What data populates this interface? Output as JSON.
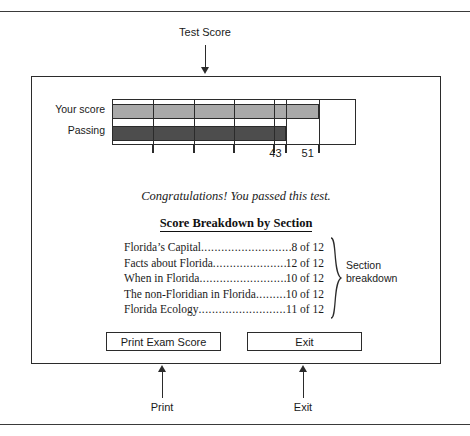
{
  "page": {
    "top_rule": true,
    "bottom_rule": true
  },
  "annotations": [
    {
      "id": "test-score",
      "label": "Test Score",
      "direction": "down"
    },
    {
      "id": "print",
      "label": "Print",
      "direction": "up"
    },
    {
      "id": "exit",
      "label": "Exit",
      "direction": "up"
    },
    {
      "id": "section-breakdown",
      "label": "Section\nbreakdown",
      "direction": "brace"
    }
  ],
  "dialog": {
    "pass_message": "Congratulations! You passed this test.",
    "breakdown_heading": "Score Breakdown by Section",
    "section_callout_line1": "Section",
    "section_callout_line2": "breakdown",
    "buttons": [
      {
        "id": "print-exam-score",
        "label": "Print Exam Score"
      },
      {
        "id": "exit",
        "label": "Exit"
      }
    ],
    "breakdown": [
      {
        "name": "Florida’s Capital",
        "score": "8 of 12",
        "earned": 8,
        "total": 12
      },
      {
        "name": "Facts about Florida",
        "score": "12 of 12",
        "earned": 12,
        "total": 12
      },
      {
        "name": "When in Florida",
        "score": "10 of 12",
        "earned": 10,
        "total": 12
      },
      {
        "name": "The non-Floridian in Florida",
        "score": "10 of 12",
        "earned": 10,
        "total": 12
      },
      {
        "name": "Florida Ecology",
        "score": "11 of 12",
        "earned": 11,
        "total": 12
      }
    ]
  },
  "chart_data": {
    "type": "bar",
    "orientation": "horizontal",
    "title": "Test Score",
    "xlabel": "",
    "ylabel": "",
    "categories": [
      "Your score",
      "Passing"
    ],
    "values": [
      51,
      43
    ],
    "value_labels": [
      "51",
      "43"
    ],
    "xlim": [
      0,
      60
    ],
    "tick_values": [
      10,
      20,
      30,
      40,
      43,
      51
    ],
    "tick_labels": [
      "",
      "",
      "",
      "",
      "43",
      "51"
    ],
    "labeled_ticks": [
      {
        "value": 43,
        "label": "43"
      },
      {
        "value": 51,
        "label": "51"
      }
    ],
    "grid": true,
    "legend": "none",
    "colors": {
      "your_score_bar": "#a9a9a9",
      "passing_bar": "#4d4d4d",
      "outline": "#2b2b2b",
      "plot_background": "#ffffff"
    }
  }
}
